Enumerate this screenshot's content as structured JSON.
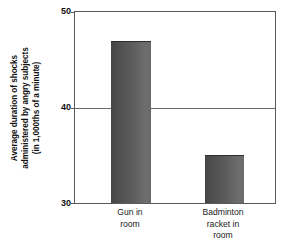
{
  "chart_data": {
    "type": "bar",
    "title": "",
    "subtitle": "",
    "xlabel": "",
    "ylabel": "Average duration of shocks administered by angry subjects (in 1,000ths of a minute)",
    "ylabel_lines": [
      "Average duration of shocks",
      "administered by angry subjects",
      "(in 1,000ths of a minute)"
    ],
    "categories": [
      "Gun in room",
      "Badminton racket in room"
    ],
    "category_lines": [
      [
        "Gun in",
        "room"
      ],
      [
        "Badminton",
        "racket in",
        "room"
      ]
    ],
    "values": [
      47,
      35
    ],
    "ylim": [
      30,
      50
    ],
    "yticks": [
      30,
      40,
      50
    ],
    "ytick_labels": [
      "30",
      "40",
      "50"
    ],
    "grid": true,
    "gridlines_at": [
      40
    ],
    "legend": null,
    "legend_position": "none",
    "bar_color": "#5a5a5a",
    "bar_color_dark": "#454545",
    "bar_color_light": "#6e6e6e",
    "frame_color": "#5a5a5a",
    "background": "#ffffff",
    "annotations": []
  }
}
